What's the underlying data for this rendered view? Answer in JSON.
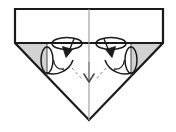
{
  "figure": {
    "title": "Origami step diagram",
    "type": "origami-instruction",
    "step_label": "",
    "canvas": {
      "width": 176,
      "height": 132,
      "background": "#ffffff"
    },
    "colors": {
      "outline": "#1a1a1a",
      "paper_front": "#ffffff",
      "paper_back": "#d2d2d2",
      "crease": "#8c8c8c",
      "arrow_fill": "#1a1a1a"
    },
    "shapes": {
      "top_rectangle": {
        "name": "upper white band",
        "points": "15,9 163,9 163,43 15,43",
        "fill": "#ffffff"
      },
      "left_gray_triangle": {
        "name": "left shaded flap",
        "points": "15,43 89,43 89,44 47,44 47,76 15,44",
        "fill": "#d2d2d2"
      },
      "right_gray_triangle": {
        "name": "right shaded flap",
        "points": "89,43 163,43 131,76 131,44 89,44",
        "fill": "#d2d2d2"
      },
      "lower_white_triangle": {
        "name": "lower white triangle",
        "points": "15,43 163,43 89,120",
        "fill": "#ffffff"
      }
    },
    "lines": {
      "outer_silhouette": "15,9 163,9 163,43 89,120 15,43 15,9",
      "center_vertical_crease": "89,9 89,120",
      "horizontal_fold_edge": "15,43 163,43"
    },
    "symbols": [
      {
        "name": "left-rotate-open-symbol",
        "kind": "open-out-arrow",
        "ellipse_top": {
          "cx": 67,
          "cy": 43,
          "rx": 15,
          "ry": 6
        },
        "ellipse_side": {
          "cx": 47,
          "cy": 60,
          "rx": 6,
          "ry": 13
        },
        "arrowhead": {
          "x": 67,
          "y": 56,
          "direction": "down-left"
        }
      },
      {
        "name": "right-rotate-open-symbol",
        "kind": "open-out-arrow",
        "ellipse_top": {
          "cx": 111,
          "cy": 43,
          "rx": 15,
          "ry": 6
        },
        "ellipse_side": {
          "cx": 131,
          "cy": 60,
          "rx": 6,
          "ry": 13
        },
        "arrowhead": {
          "x": 111,
          "y": 56,
          "direction": "down-right"
        }
      },
      {
        "name": "center-fold-down-arrow",
        "kind": "valley-fold-arrow",
        "from": {
          "x": 89,
          "y": 62
        },
        "to": {
          "x": 89,
          "y": 83
        },
        "direction": "down"
      }
    ],
    "dashed_creases": [
      {
        "name": "left-dashed-crease",
        "from": {
          "x": 72,
          "y": 68
        },
        "to": {
          "x": 82,
          "y": 79
        }
      },
      {
        "name": "right-dashed-crease",
        "from": {
          "x": 106,
          "y": 68
        },
        "to": {
          "x": 96,
          "y": 79
        }
      }
    ]
  }
}
